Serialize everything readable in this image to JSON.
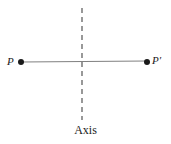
{
  "figure": {
    "type": "reflection-diagram",
    "background_color": "#ffffff",
    "segment_color": "#808080",
    "axis_color": "#555555",
    "point_color": "#1a1a1a",
    "label_color": "#1a1a1a",
    "caption": "Axis",
    "points": [
      {
        "id": "P",
        "label": "P",
        "x": 21,
        "y": 62,
        "label_x": 7,
        "label_y": 62
      },
      {
        "id": "P-prime",
        "label": "P′",
        "x": 147,
        "y": 62,
        "label_x": 152,
        "label_y": 61
      }
    ],
    "segment": {
      "name": "segment-PP-prime",
      "x1": 21,
      "y1": 62,
      "x2": 147,
      "y2": 61,
      "stroke_width": 1.2,
      "style": "solid"
    },
    "axis_line": {
      "name": "axis-of-reflection",
      "x": 82,
      "y_top": 8,
      "y_bottom": 120,
      "stroke_width": 1.2,
      "style": "dashed",
      "dash_pattern": "5 4"
    },
    "point_radius": 3
  }
}
